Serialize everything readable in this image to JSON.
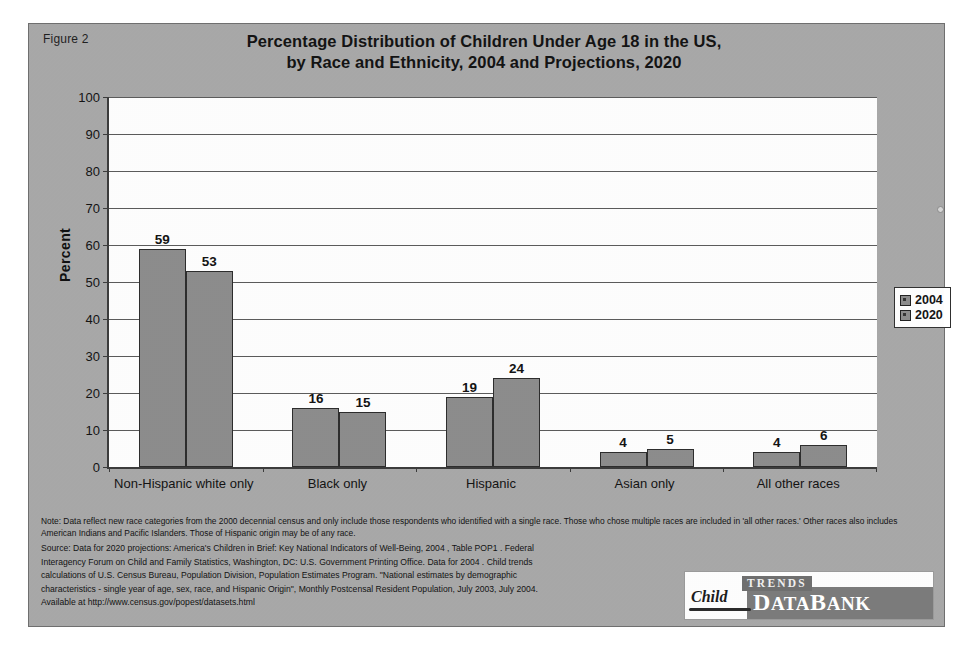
{
  "figure_label": "Figure 2",
  "title_line1": "Percentage Distribution of Children Under Age 18 in the US,",
  "title_line2": "by Race and Ethnicity, 2004 and Projections, 2020",
  "chart_data": {
    "type": "bar",
    "title": "Percentage Distribution of Children Under Age 18 in the US, by Race and Ethnicity, 2004 and Projections, 2020",
    "xlabel": "",
    "ylabel": "Percent",
    "ylim": [
      0,
      100
    ],
    "ytick_step": 10,
    "yticks": [
      "100",
      "90",
      "80",
      "70",
      "60",
      "50",
      "40",
      "30",
      "20",
      "10",
      "0"
    ],
    "grid": true,
    "legend_position": "right",
    "categories": [
      "Non-Hispanic white only",
      "Black only",
      "Hispanic",
      "Asian only",
      "All other races"
    ],
    "series": [
      {
        "name": "2004",
        "values": [
          59,
          16,
          19,
          4,
          4
        ],
        "color": "#8c8c8c"
      },
      {
        "name": "2020",
        "values": [
          53,
          15,
          24,
          5,
          6
        ],
        "color": "#8c8c8c"
      }
    ]
  },
  "legend": {
    "items": [
      {
        "label": "2004"
      },
      {
        "label": "2020"
      }
    ]
  },
  "note": "Note: Data reflect new race categories from the 2000 decennial census and only include those respondents who identified with a single race. Those who chose multiple races are included in 'all other races.' Other races also includes American Indians and Pacific Islanders. Those of Hispanic origin may be of any race.",
  "source": {
    "line1": "Source: Data for 2020 projections: America's Children in Brief: Key National Indicators of Well-Being, 2004 , Table POP1 .  Federal",
    "line2": "Interagency Forum on Child and Family Statistics, Washington, DC: U.S. Government Printing Office.  Data for  2004 .  Child trends",
    "line3": "calculations of U.S. Census Bureau, Population Division, Population Estimates Program. \"National estimates by demographic",
    "line4": "characteristics - single year of age, sex, race, and Hispanic Origin\", Monthly Postcensal Resident Population, July 2003, July 2004.",
    "line5": "Available at http://www.census.gov/popest/datasets.html"
  },
  "logo": {
    "child": "Child",
    "trends": "TRENDS",
    "databank_d": "D",
    "databank_ata": "ATA",
    "databank_b": "B",
    "databank_ank": "ANK"
  }
}
